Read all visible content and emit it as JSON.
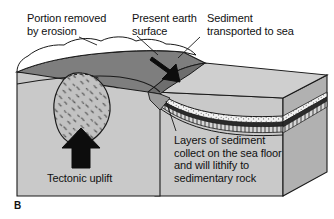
{
  "figure": {
    "panel_letter": "B",
    "type": "geologic block diagram",
    "labels": {
      "portion_removed": "Portion removed\nby erosion",
      "present_surface": "Present earth\nsurface",
      "sediment_transported": "Sediment\ntransported to sea",
      "seafloor_note": "Layers of sediment\ncollect on the sea floor\nand will lithify to\nsedimentary rock",
      "tectonic_uplift": "Tectonic uplift"
    },
    "icons": {
      "sediment_transport_arrow": "arrow-down-right-icon",
      "uplift_arrow": "arrow-up-icon",
      "leader_lines": "leader-line-icon"
    },
    "colors": {
      "background": "#ffffff",
      "block_front": "#c9c9c9",
      "block_right": "#b4b4b4",
      "top_surface_dark": "#7f7f7f",
      "top_surface_mid": "#8d8d8d",
      "sea_top": "#cfcfcf",
      "eroded_void": "#ffffff",
      "pluton_fill": "#c0c0c0",
      "sediment_white": "#f4f4f4",
      "sediment_dark": "#2b2b2b",
      "outline": "#1a1a1a",
      "text": "#111111"
    }
  }
}
